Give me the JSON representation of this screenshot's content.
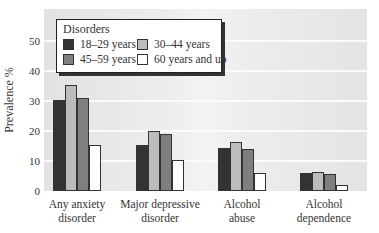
{
  "chart_data": {
    "type": "bar",
    "title": "",
    "xlabel": "",
    "ylabel": "Prevalence %",
    "ylim": [
      0,
      60
    ],
    "yticks": [
      0,
      10,
      20,
      30,
      40,
      50
    ],
    "grid": true,
    "legend_position": "top-left",
    "legend_title": "Disorders",
    "categories": [
      "Any anxiety disorder",
      "Major depressive disorder",
      "Alcohol abuse",
      "Alcohol dependence"
    ],
    "category_labels": [
      [
        "Any anxiety",
        "disorder"
      ],
      [
        "Major depressive",
        "disorder"
      ],
      [
        "Alcohol",
        "abuse"
      ],
      [
        "Alcohol",
        "dependence"
      ]
    ],
    "series": [
      {
        "name": "18–29 years",
        "color": "#333333",
        "values": [
          30.5,
          15.5,
          14.5,
          6.0
        ]
      },
      {
        "name": "30–44 years",
        "color": "#bcbcbc",
        "values": [
          35.5,
          20.0,
          16.5,
          6.3
        ]
      },
      {
        "name": "45–59 years",
        "color": "#7f7f7f",
        "values": [
          31.0,
          19.0,
          14.0,
          5.8
        ]
      },
      {
        "name": "60 years and up",
        "color": "#ffffff",
        "values": [
          15.3,
          10.5,
          6.0,
          2.0
        ]
      }
    ]
  },
  "legend": {
    "title": "Disorders",
    "items": [
      {
        "label": "18–29 years",
        "color": "#333333"
      },
      {
        "label": "30–44 years",
        "color": "#bcbcbc"
      },
      {
        "label": "45–59 years",
        "color": "#7f7f7f"
      },
      {
        "label": "60 years and up",
        "color": "#ffffff"
      }
    ]
  },
  "axis": {
    "ylabel": "Prevalence %",
    "ticks": [
      "0",
      "10",
      "20",
      "30",
      "40",
      "50"
    ]
  }
}
